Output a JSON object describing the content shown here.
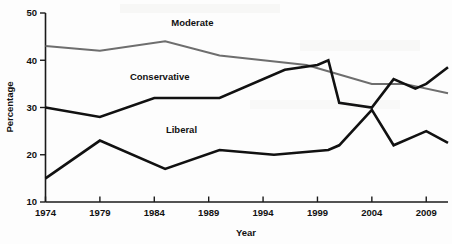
{
  "chart_data": {
    "type": "line",
    "title": "",
    "xlabel": "Year",
    "ylabel": "Percentage",
    "xlim": [
      1974,
      2011
    ],
    "ylim": [
      10,
      50
    ],
    "xticks": [
      1974,
      1979,
      1984,
      1989,
      1994,
      1999,
      2004,
      2009
    ],
    "yticks": [
      10,
      20,
      30,
      40,
      50
    ],
    "grid": false,
    "legend_position": "inline-labels",
    "series": [
      {
        "name": "Moderate",
        "color": "#6e6e6e",
        "x": [
          1974,
          1979,
          1985,
          1990,
          1994,
          1998,
          2001,
          2004,
          2007,
          2011
        ],
        "values": [
          43,
          42,
          44,
          41,
          40,
          39,
          37,
          35,
          35,
          33
        ]
      },
      {
        "name": "Conservative",
        "color": "#111111",
        "x": [
          1974,
          1979,
          1984,
          1990,
          1996,
          1999,
          2000,
          2001,
          2004,
          2006,
          2008,
          2009,
          2011
        ],
        "values": [
          30,
          28,
          32,
          32,
          38,
          39,
          40,
          31,
          30,
          36,
          34,
          35,
          38.5
        ]
      },
      {
        "name": "Liberal",
        "color": "#111111",
        "x": [
          1974,
          1979,
          1985,
          1990,
          1995,
          2000,
          2001,
          2004,
          2006,
          2008,
          2009,
          2011
        ],
        "values": [
          15,
          23,
          17,
          21,
          20,
          21,
          22,
          29.5,
          22,
          24,
          25,
          22.5
        ]
      }
    ],
    "series_label_positions": [
      {
        "name": "Moderate",
        "year": 1987.5,
        "value": 47.2
      },
      {
        "name": "Conservative",
        "year": 1984.5,
        "value": 35.8
      },
      {
        "name": "Liberal",
        "year": 1986.5,
        "value": 24.6
      }
    ]
  }
}
